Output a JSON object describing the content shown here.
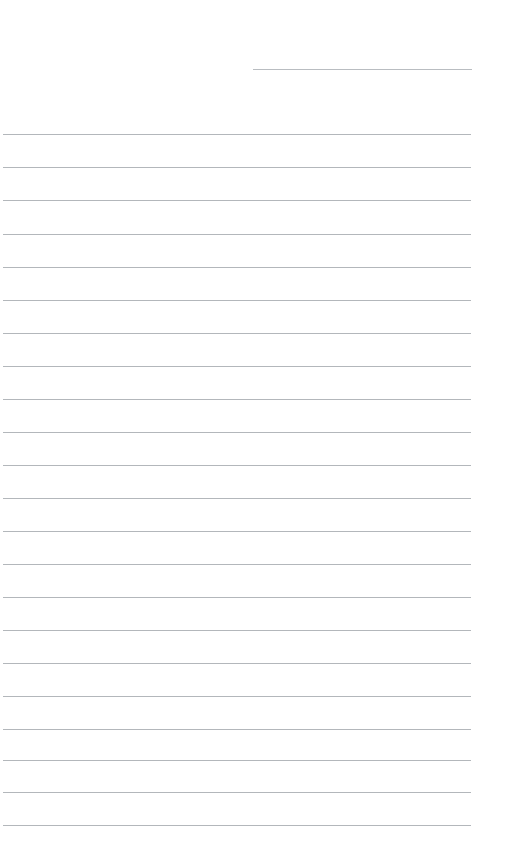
{
  "document": {
    "kind": "lined-writing-paper",
    "title": "",
    "page_width": 520,
    "page_height": 863,
    "background_color": "#ffffff",
    "rule_color": "#b3b7bb",
    "rule_thickness_px": 1,
    "text_content": "",
    "placeholder": ""
  },
  "layout": {
    "left_margin_px": 3,
    "right_margin_px": 471,
    "full_rule_width_px": 468,
    "first_full_rule_y_px": 134,
    "rule_spacing_px": 33.2,
    "full_rule_count": 22
  },
  "header_rule": {
    "label": "header-blank-rule",
    "x_px": 253,
    "y_px": 69,
    "width_px": 219,
    "value": "",
    "placeholder": ""
  },
  "rules": [
    {
      "index": 1,
      "y_px": 134,
      "x_px": 3,
      "width_px": 468,
      "value": ""
    },
    {
      "index": 2,
      "y_px": 167,
      "x_px": 3,
      "width_px": 468,
      "value": ""
    },
    {
      "index": 3,
      "y_px": 200,
      "x_px": 3,
      "width_px": 468,
      "value": ""
    },
    {
      "index": 4,
      "y_px": 234,
      "x_px": 3,
      "width_px": 468,
      "value": ""
    },
    {
      "index": 5,
      "y_px": 267,
      "x_px": 3,
      "width_px": 468,
      "value": ""
    },
    {
      "index": 6,
      "y_px": 300,
      "x_px": 3,
      "width_px": 468,
      "value": ""
    },
    {
      "index": 7,
      "y_px": 333,
      "x_px": 3,
      "width_px": 468,
      "value": ""
    },
    {
      "index": 8,
      "y_px": 366,
      "x_px": 3,
      "width_px": 468,
      "value": ""
    },
    {
      "index": 9,
      "y_px": 399,
      "x_px": 3,
      "width_px": 468,
      "value": ""
    },
    {
      "index": 10,
      "y_px": 432,
      "x_px": 3,
      "width_px": 468,
      "value": ""
    },
    {
      "index": 11,
      "y_px": 465,
      "x_px": 3,
      "width_px": 468,
      "value": ""
    },
    {
      "index": 12,
      "y_px": 498,
      "x_px": 3,
      "width_px": 468,
      "value": ""
    },
    {
      "index": 13,
      "y_px": 531,
      "x_px": 3,
      "width_px": 468,
      "value": ""
    },
    {
      "index": 14,
      "y_px": 564,
      "x_px": 3,
      "width_px": 468,
      "value": ""
    },
    {
      "index": 15,
      "y_px": 597,
      "x_px": 3,
      "width_px": 468,
      "value": ""
    },
    {
      "index": 16,
      "y_px": 630,
      "x_px": 3,
      "width_px": 468,
      "value": ""
    },
    {
      "index": 17,
      "y_px": 663,
      "x_px": 3,
      "width_px": 468,
      "value": ""
    },
    {
      "index": 18,
      "y_px": 696,
      "x_px": 3,
      "width_px": 468,
      "value": ""
    },
    {
      "index": 19,
      "y_px": 729,
      "x_px": 3,
      "width_px": 468,
      "value": ""
    },
    {
      "index": 20,
      "y_px": 760,
      "x_px": 3,
      "width_px": 468,
      "value": ""
    },
    {
      "index": 21,
      "y_px": 792,
      "x_px": 3,
      "width_px": 468,
      "value": ""
    },
    {
      "index": 22,
      "y_px": 825,
      "x_px": 3,
      "width_px": 468,
      "value": ""
    }
  ]
}
